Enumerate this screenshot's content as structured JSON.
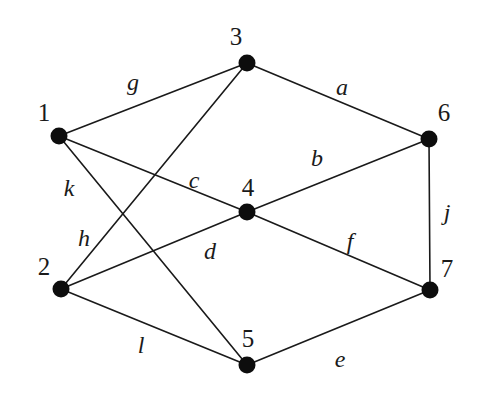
{
  "figure": {
    "kind": "undirected-graph-diagram",
    "width": 482,
    "height": 394,
    "background_color": "#ffffff",
    "ink_color": "#1a1a1a",
    "vertex_color": "#0d0d0d"
  },
  "vertices": [
    {
      "id": "1",
      "label": "1",
      "cx": 59,
      "cy": 136,
      "r": 8.5,
      "label_x": 44,
      "label_y": 112
    },
    {
      "id": "2",
      "label": "2",
      "cx": 61,
      "cy": 289,
      "r": 8.5,
      "label_x": 44,
      "label_y": 266
    },
    {
      "id": "3",
      "label": "3",
      "cx": 247,
      "cy": 63,
      "r": 8.5,
      "label_x": 236,
      "label_y": 36
    },
    {
      "id": "4",
      "label": "4",
      "cx": 247,
      "cy": 212,
      "r": 8.5,
      "label_x": 248,
      "label_y": 187
    },
    {
      "id": "5",
      "label": "5",
      "cx": 247,
      "cy": 365,
      "r": 8.5,
      "label_x": 248,
      "label_y": 338
    },
    {
      "id": "6",
      "label": "6",
      "cx": 429,
      "cy": 139,
      "r": 8.5,
      "label_x": 444,
      "label_y": 112
    },
    {
      "id": "7",
      "label": "7",
      "cx": 430,
      "cy": 290,
      "r": 8.5,
      "label_x": 447,
      "label_y": 268
    }
  ],
  "edges": [
    {
      "id": "a",
      "label": "a",
      "from": "3",
      "to": "6",
      "label_x": 342,
      "label_y": 87
    },
    {
      "id": "b",
      "label": "b",
      "from": "4",
      "to": "6",
      "label_x": 317,
      "label_y": 158
    },
    {
      "id": "c",
      "label": "c",
      "from": "1",
      "to": "4",
      "label_x": 194,
      "label_y": 180
    },
    {
      "id": "d",
      "label": "d",
      "from": "2",
      "to": "4",
      "label_x": 210,
      "label_y": 251
    },
    {
      "id": "e",
      "label": "e",
      "from": "5",
      "to": "7",
      "label_x": 340,
      "label_y": 359
    },
    {
      "id": "f",
      "label": "f",
      "from": "4",
      "to": "7",
      "label_x": 350,
      "label_y": 241
    },
    {
      "id": "g",
      "label": "g",
      "from": "1",
      "to": "3",
      "label_x": 133,
      "label_y": 82
    },
    {
      "id": "h",
      "label": "h",
      "from": "2",
      "to": "3",
      "label_x": 84,
      "label_y": 238
    },
    {
      "id": "j",
      "label": "j",
      "from": "6",
      "to": "7",
      "label_x": 447,
      "label_y": 212
    },
    {
      "id": "k",
      "label": "k",
      "from": "1",
      "to": "5",
      "label_x": 69,
      "label_y": 188
    },
    {
      "id": "l",
      "label": "l",
      "from": "2",
      "to": "5",
      "label_x": 141,
      "label_y": 345
    }
  ]
}
